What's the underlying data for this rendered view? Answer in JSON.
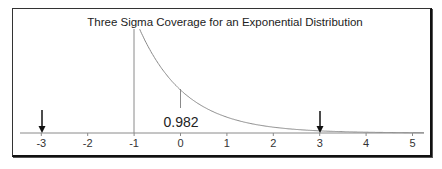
{
  "chart_data": {
    "type": "line",
    "title": "Three Sigma Coverage for an Exponential Distribution",
    "xlabel": "",
    "ylabel": "",
    "xlim": [
      -3.5,
      5.25
    ],
    "x_ticks": [
      -3,
      -2,
      -1,
      0,
      1,
      2,
      3,
      4,
      5
    ],
    "x_tick_labels": [
      "-3",
      "-2",
      "-1",
      "0",
      "1",
      "2",
      "3",
      "4",
      "5"
    ],
    "grid": false,
    "legend": null,
    "series": [
      {
        "name": "Standardized exponential pdf",
        "function": "f(x) = exp(-(x+1)) for x >= -1",
        "x": [
          -1,
          -0.5,
          0,
          0.5,
          1,
          1.5,
          2,
          2.5,
          3,
          3.5,
          4,
          4.5,
          5
        ],
        "values": [
          1.0,
          0.607,
          0.368,
          0.223,
          0.135,
          0.082,
          0.05,
          0.03,
          0.018,
          0.011,
          0.007,
          0.004,
          0.002
        ],
        "color": "#8a8a8a"
      }
    ],
    "vertical_lines": [
      {
        "x": -1,
        "label": "support start",
        "color": "#8a8a8a"
      },
      {
        "x": 0,
        "label": "mean",
        "color": "#8a8a8a"
      }
    ],
    "arrows": [
      {
        "x": -3,
        "label": "mean - 3 sigma",
        "color": "#111111"
      },
      {
        "x": 3,
        "label": "mean + 3 sigma",
        "color": "#111111"
      }
    ],
    "annotations": [
      {
        "text": "0.982",
        "x": 0,
        "meaning": "probability within three sigma"
      }
    ]
  },
  "labels": {
    "title": "Three Sigma Coverage for an Exponential Distribution",
    "coverage": "0.982",
    "ticks": [
      "-3",
      "-2",
      "-1",
      "0",
      "1",
      "2",
      "3",
      "4",
      "5"
    ]
  }
}
